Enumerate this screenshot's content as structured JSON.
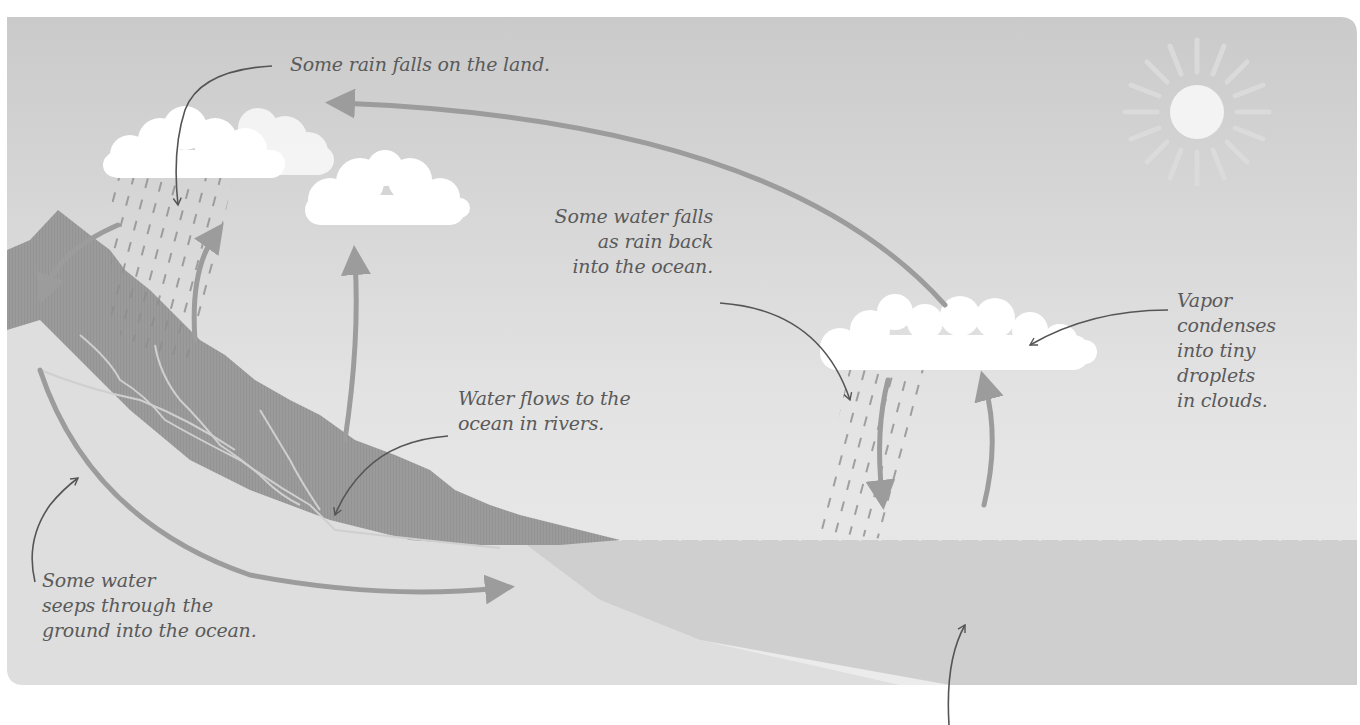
{
  "diagram": {
    "colors": {
      "sky_top": "#c8c8c8",
      "sky_bottom": "#ececec",
      "land": "#9a9a9a",
      "ground": "#dcdcdc",
      "ocean": "#cfcfcf",
      "arrow": "#9c9c9c",
      "leader": "#555555",
      "cloud": "#ffffff",
      "sun": "#f2f2f2",
      "text": "#5a5a5a"
    },
    "labels": {
      "rain_on_land": "Some rain falls on the land.",
      "rain_on_ocean": "Some water falls\nas rain back\ninto the ocean.",
      "rivers": "Water flows to the\nocean in rivers.",
      "condense": "Vapor\ncondenses\ninto tiny\ndroplets\nin clouds.",
      "seepage": "Some water\nseeps through the\nground into the ocean."
    },
    "elements": {
      "sun": "sun-icon",
      "clouds": [
        "land-rain-cloud",
        "land-cloud",
        "ocean-rain-cloud"
      ],
      "arrows": [
        "vapor-transport-arrow",
        "runoff-down-arrow",
        "evaporation-land-arrow-1",
        "evaporation-land-arrow-2",
        "ocean-rain-down-arrow",
        "ocean-evaporation-up-arrow",
        "groundwater-seepage-arrow"
      ]
    }
  }
}
